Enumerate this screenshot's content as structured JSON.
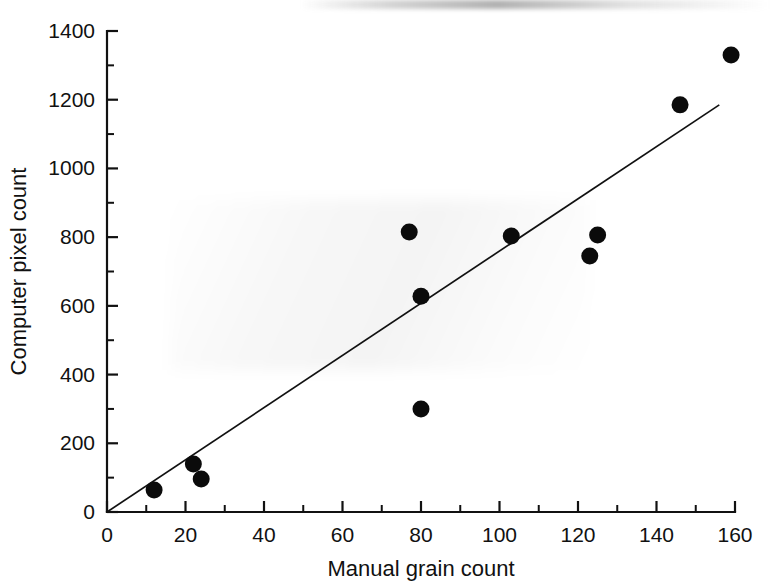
{
  "chart_data": {
    "type": "scatter",
    "title": "",
    "xlabel": "Manual grain count",
    "ylabel": "Computer pixel count",
    "xlim": [
      0,
      160
    ],
    "ylim": [
      0,
      1400
    ],
    "grid": false,
    "legend": null,
    "xticks": [
      0,
      20,
      40,
      60,
      80,
      100,
      120,
      140,
      160
    ],
    "xtick_labels": [
      "0",
      "20",
      "40",
      "60",
      "80",
      "100",
      "120",
      "140",
      "160"
    ],
    "xminor_ticks": [
      10,
      30,
      50,
      70,
      90,
      110,
      130,
      150
    ],
    "yticks": [
      0,
      200,
      400,
      600,
      800,
      1000,
      1200,
      1400
    ],
    "ytick_labels": [
      "0",
      "200",
      "400",
      "600",
      "800",
      "1000",
      "1200",
      "1400"
    ],
    "yminor_ticks": [
      100,
      300,
      500,
      700,
      900,
      1100,
      1300
    ],
    "marker": "filled-circle",
    "marker_color": "#0b0b0b",
    "marker_size_px": 17,
    "points": [
      {
        "x": 12,
        "y": 64
      },
      {
        "x": 22,
        "y": 140
      },
      {
        "x": 24,
        "y": 96
      },
      {
        "x": 77,
        "y": 815
      },
      {
        "x": 80,
        "y": 628
      },
      {
        "x": 80,
        "y": 300
      },
      {
        "x": 103,
        "y": 803
      },
      {
        "x": 123,
        "y": 745
      },
      {
        "x": 125,
        "y": 806
      },
      {
        "x": 146,
        "y": 1185
      },
      {
        "x": 159,
        "y": 1330
      }
    ],
    "fit_line": {
      "type": "linear",
      "through_origin": true,
      "slope": 7.6,
      "intercept": 0,
      "x_start": 0,
      "y_start": 0,
      "x_end": 156,
      "y_end": 1185,
      "color": "#111111"
    }
  },
  "figure": {
    "background_color": "#ffffff",
    "axis_color": "#111111"
  }
}
